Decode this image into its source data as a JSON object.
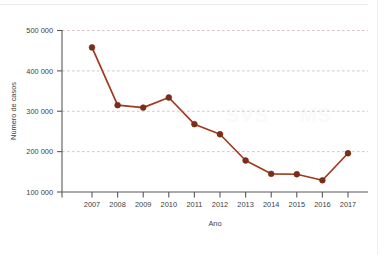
{
  "chart_data": {
    "type": "line",
    "title": "",
    "xlabel": "Ano",
    "ylabel": "Número de casos",
    "categories": [
      "2007",
      "2008",
      "2009",
      "2010",
      "2011",
      "2012",
      "2013",
      "2014",
      "2015",
      "2016",
      "2017"
    ],
    "values": [
      458000,
      315000,
      309000,
      334000,
      268000,
      243000,
      178000,
      145000,
      144000,
      129000,
      196000
    ],
    "series": [
      {
        "name": "Número de casos",
        "values": [
          458000,
          315000,
          309000,
          334000,
          268000,
          243000,
          178000,
          145000,
          144000,
          129000,
          196000
        ]
      }
    ],
    "ylim": [
      100000,
      500000
    ],
    "yticks": [
      100000,
      200000,
      300000,
      400000,
      500000
    ],
    "ytick_labels": [
      "100 000",
      "200 000",
      "300 000",
      "400 000",
      "500 000"
    ],
    "xtick_labels": [
      "2007",
      "2008",
      "2009",
      "2010",
      "2011",
      "2012",
      "2013",
      "2014",
      "2015",
      "2016",
      "2017"
    ],
    "grid": "horizontal-dashed",
    "legend": "none",
    "line_color": "#a0391f",
    "marker_color": "#7a2d18",
    "grid_color": "#c9b8b4",
    "axis_color": "#58595b",
    "background": "#ffffff"
  },
  "watermark": {
    "text_left": "SVS",
    "text_right": "MS"
  }
}
